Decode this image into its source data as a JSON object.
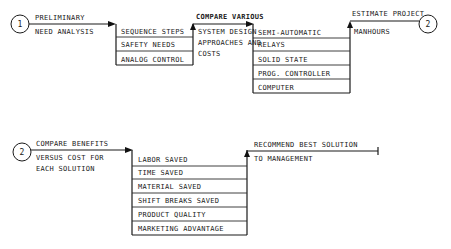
{
  "diagram": {
    "row1": {
      "start_node": "1",
      "step1": {
        "line1": "PRELIMINARY",
        "line2": "NEED ANALYSIS"
      },
      "box1": {
        "items": [
          "SEQUENCE STEPS",
          "SAFETY NEEDS",
          "ANALOG CONTROL"
        ]
      },
      "step2": {
        "line1": "COMPARE VARIOUS",
        "line2": "SYSTEM DESIGN",
        "line3": "APPROACHES AND",
        "line4": "COSTS"
      },
      "box2": {
        "items": [
          "SEMI-AUTOMATIC",
          "RELAYS",
          "SOLID STATE",
          "PROG. CONTROLLER",
          "COMPUTER"
        ]
      },
      "step3": {
        "line1": "ESTIMATE PROJECT",
        "line2": "MANHOURS"
      },
      "end_node": "2"
    },
    "row2": {
      "start_node": "2",
      "step1": {
        "line1": "COMPARE BENEFITS",
        "line2": "VERSUS COST FOR",
        "line3": "EACH SOLUTION"
      },
      "box1": {
        "items": [
          "LABOR SAVED",
          "TIME SAVED",
          "MATERIAL SAVED",
          "SHIFT BREAKS SAVED",
          "PRODUCT QUALITY",
          "MARKETING ADVANTAGE"
        ]
      },
      "step2": {
        "line1": "RECOMMEND BEST SOLUTION",
        "line2": "TO MANAGEMENT"
      }
    },
    "colors": {
      "line": "#1a1a1a",
      "background": "#ffffff"
    }
  }
}
